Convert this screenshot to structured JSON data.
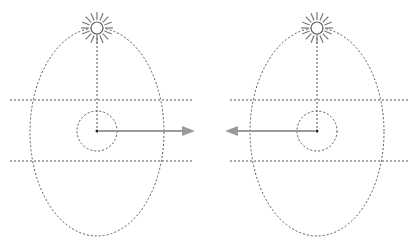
{
  "diagram": {
    "colors": {
      "dashed": "#555555",
      "arrow": "#9a9a9a",
      "sun": "#666666",
      "background": "#ffffff"
    },
    "panels": [
      {
        "name": "left",
        "arrow_direction": "right"
      },
      {
        "name": "right",
        "arrow_direction": "left"
      }
    ]
  }
}
